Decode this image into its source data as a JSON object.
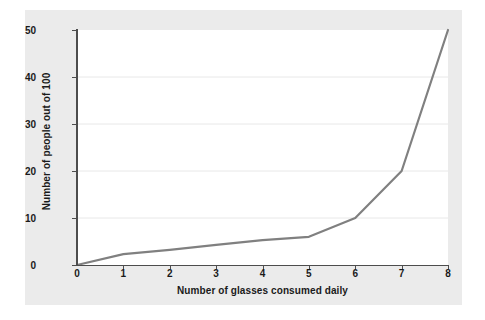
{
  "chart_data": {
    "type": "line",
    "title": "",
    "subtitle": "",
    "xlabel": "Number of glasses consumed daily",
    "ylabel": "Number of people out of 100",
    "x": [
      0,
      1,
      2,
      3,
      4,
      5,
      6,
      7,
      8
    ],
    "values": [
      0,
      2.3,
      3.2,
      4.3,
      5.3,
      6,
      10,
      20,
      50
    ],
    "series": [
      {
        "name": "Number of people out of 100",
        "values": [
          0,
          2.3,
          3.2,
          4.3,
          5.3,
          6,
          10,
          20,
          50
        ],
        "color": "#808080"
      }
    ],
    "xlim": [
      0,
      8
    ],
    "ylim": [
      0,
      50
    ],
    "xticks": [
      0,
      1,
      2,
      3,
      4,
      5,
      6,
      7,
      8
    ],
    "yticks": [
      0,
      10,
      20,
      30,
      40,
      50
    ],
    "xtick_labels": [
      "0",
      "1",
      "2",
      "3",
      "4",
      "5",
      "6",
      "7",
      "8"
    ],
    "ytick_labels": [
      "0",
      "10",
      "20",
      "30",
      "40",
      "50"
    ],
    "grid": "horizontal",
    "gridlines_at": [
      10,
      20,
      30,
      40
    ],
    "legend": "none",
    "annotations": []
  },
  "colors": {
    "page_background": "#ffffff",
    "figure_background": "#ebebeb",
    "plot_background": "#ffffff",
    "line": "#808080",
    "axis": "#4d4d4d",
    "gridline": "#e8e8e8",
    "text": "#1a1a1a"
  }
}
